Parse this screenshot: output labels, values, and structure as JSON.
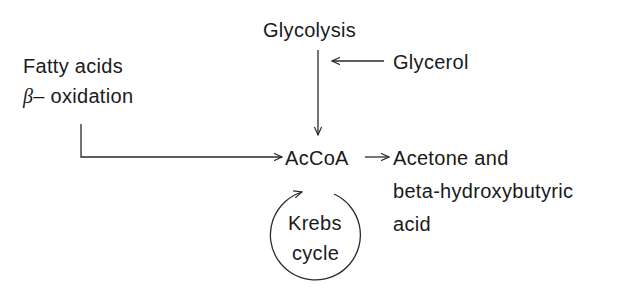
{
  "diagram": {
    "nodes": {
      "glycolysis": "Glycolysis",
      "glycerol": "Glycerol",
      "fatty_acids": "Fatty acids",
      "beta_symbol": "β",
      "beta_oxidation": "– oxidation",
      "accoa": "AcCoA",
      "products_line1": "Acetone and",
      "products_line2": "beta-hydroxybutyric",
      "products_line3": "acid",
      "krebs_line1": "Krebs",
      "krebs_line2": "cycle"
    },
    "edges": [
      {
        "from": "Glycolysis",
        "to": "AcCoA"
      },
      {
        "from": "Glycerol",
        "to": "Glycolysis→AcCoA path"
      },
      {
        "from": "Fatty acids β-oxidation",
        "to": "AcCoA"
      },
      {
        "from": "AcCoA",
        "to": "Acetone and beta-hydroxybutyric acid"
      },
      {
        "from": "Krebs cycle",
        "to": "AcCoA",
        "type": "cycle"
      }
    ],
    "colors": {
      "line": "#2a2a2a",
      "text": "#1a1a1a",
      "background": "#ffffff"
    }
  }
}
